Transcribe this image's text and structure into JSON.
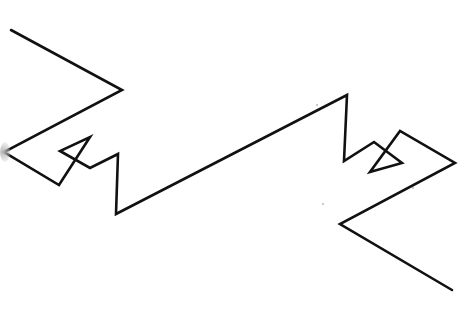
{
  "drawing": {
    "stroke_color": "#111111",
    "stroke_width": 2.6,
    "background": "#ffffff",
    "polyline": [
      [
        11,
        30
      ],
      [
        122,
        90
      ],
      [
        4,
        152
      ],
      [
        59,
        185
      ],
      [
        90,
        137
      ],
      [
        60,
        151
      ],
      [
        90,
        168
      ],
      [
        118,
        154
      ],
      [
        116,
        214
      ],
      [
        347,
        95
      ],
      [
        344,
        161
      ],
      [
        374,
        142
      ],
      [
        402,
        163
      ],
      [
        370,
        172
      ],
      [
        400,
        131
      ],
      [
        455,
        163
      ],
      [
        340,
        224
      ],
      [
        452,
        290
      ]
    ],
    "specks": [
      [
        316,
        104
      ],
      [
        322,
        203
      ],
      [
        412,
        187
      ]
    ]
  }
}
